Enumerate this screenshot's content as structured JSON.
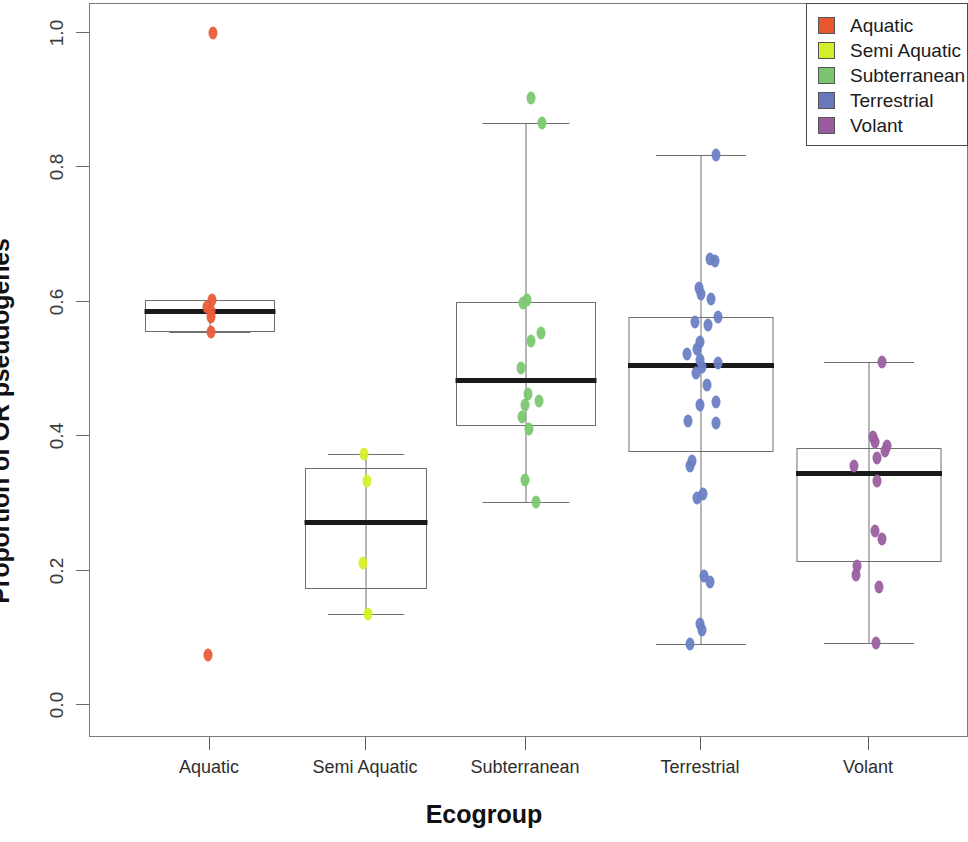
{
  "chart_data": {
    "type": "box",
    "title": "",
    "xlabel": "Ecogroup",
    "ylabel": "Proportion of OR pseudogenes",
    "ylim": [
      0.0,
      1.0
    ],
    "yticks": [
      "0.0",
      "0.2",
      "0.4",
      "0.6",
      "0.8",
      "1.0"
    ],
    "ytick_values": [
      0.0,
      0.2,
      0.4,
      0.6,
      0.8,
      1.0
    ],
    "grid": false,
    "legend_position": "top-right",
    "categories": [
      "Aquatic",
      "Semi Aquatic",
      "Subterranean",
      "Terrestrial",
      "Volant"
    ],
    "colors": {
      "Aquatic": "#ea5c3a",
      "Semi Aquatic": "#d7f028",
      "Subterranean": "#7cc772",
      "Terrestrial": "#6b7fc4",
      "Volant": "#9b5fa0"
    },
    "boxes": [
      {
        "category": "Aquatic",
        "whisker_low": 0.555,
        "q1": 0.555,
        "median": 0.586,
        "q3": 0.603,
        "whisker_high": 0.603,
        "points": [
          1.0,
          0.603,
          0.592,
          0.586,
          0.578,
          0.555,
          0.075
        ]
      },
      {
        "category": "Semi Aquatic",
        "whisker_low": 0.135,
        "q1": 0.173,
        "median": 0.272,
        "q3": 0.352,
        "whisker_high": 0.374,
        "points": [
          0.374,
          0.334,
          0.212,
          0.135
        ]
      },
      {
        "category": "Subterranean",
        "whisker_low": 0.302,
        "q1": 0.415,
        "median": 0.483,
        "q3": 0.6,
        "whisker_high": 0.866,
        "points": [
          0.903,
          0.866,
          0.603,
          0.598,
          0.553,
          0.542,
          0.501,
          0.463,
          0.452,
          0.446,
          0.428,
          0.411,
          0.335,
          0.302
        ]
      },
      {
        "category": "Terrestrial",
        "whisker_low": 0.091,
        "q1": 0.376,
        "median": 0.506,
        "q3": 0.578,
        "whisker_high": 0.818,
        "points": [
          0.818,
          0.664,
          0.661,
          0.62,
          0.611,
          0.604,
          0.578,
          0.57,
          0.566,
          0.54,
          0.53,
          0.523,
          0.513,
          0.509,
          0.503,
          0.494,
          0.476,
          0.451,
          0.446,
          0.423,
          0.419,
          0.363,
          0.356,
          0.314,
          0.308,
          0.192,
          0.183,
          0.12,
          0.112,
          0.091
        ]
      },
      {
        "category": "Volant",
        "whisker_low": 0.092,
        "q1": 0.213,
        "median": 0.345,
        "q3": 0.383,
        "whisker_high": 0.511,
        "points": [
          0.511,
          0.399,
          0.392,
          0.386,
          0.378,
          0.367,
          0.356,
          0.333,
          0.259,
          0.247,
          0.207,
          0.194,
          0.176,
          0.092
        ]
      }
    ]
  },
  "legend": {
    "items": [
      {
        "label": "Aquatic",
        "color": "#e8562e"
      },
      {
        "label": "Semi Aquatic",
        "color": "#d4ef2a"
      },
      {
        "label": "Subterranean",
        "color": "#7cc46f"
      },
      {
        "label": "Terrestrial",
        "color": "#6977bd"
      },
      {
        "label": "Volant",
        "color": "#9a5b9e"
      }
    ]
  }
}
